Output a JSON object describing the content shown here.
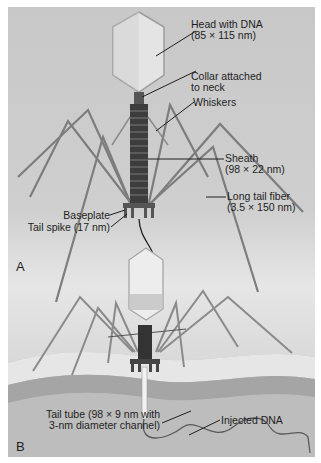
{
  "figure": {
    "panel_a": {
      "letter": "A",
      "labels": {
        "head_line1": "Head with DNA",
        "head_line2": "(85 × 115 nm)",
        "collar_line1": "Collar attached",
        "collar_line2": "to neck",
        "whiskers": "Whiskers",
        "sheath_line1": "Sheath",
        "sheath_line2": "(98 × 22 nm)",
        "baseplate": "Baseplate",
        "tail_spike": "Tail spike (17 nm)",
        "long_fiber_line1": "Long tail fiber",
        "long_fiber_line2": "(3.5 × 150 nm)"
      }
    },
    "panel_b": {
      "letter": "B",
      "labels": {
        "tail_tube_line1": "Tail tube (98 × 9 nm with",
        "tail_tube_line2": "3-nm diameter channel)",
        "injected_dna": "Injected DNA"
      }
    },
    "colors": {
      "background": "#c8c8c8",
      "structure_dark": "#3a3a3a",
      "fiber": "#7a7a7a",
      "leader_line": "#1e1e1e",
      "membrane_light": "#e8e8e8",
      "membrane_dark": "#9a9a9a"
    }
  }
}
